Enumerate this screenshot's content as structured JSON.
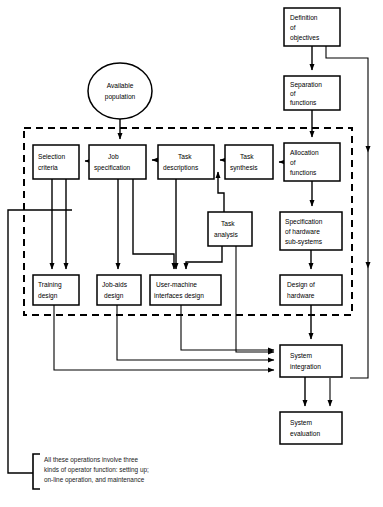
{
  "diagram": {
    "nodes": [
      {
        "id": "definition_objectives",
        "label": [
          "Definition",
          "of",
          "objectives"
        ],
        "shape": "box",
        "x": 284,
        "y": 8,
        "w": 56,
        "h": 38
      },
      {
        "id": "separation_functions",
        "label": [
          "Separation",
          "of",
          "functions"
        ],
        "shape": "box",
        "x": 284,
        "y": 76,
        "w": 56,
        "h": 34
      },
      {
        "id": "allocation_functions",
        "label": [
          "Allocation",
          "of",
          "functions"
        ],
        "shape": "box",
        "x": 284,
        "y": 143,
        "w": 56,
        "h": 38
      },
      {
        "id": "specification_hardware",
        "label": [
          "Specification",
          "of hardware",
          "sub-systems"
        ],
        "shape": "box",
        "x": 280,
        "y": 212,
        "w": 62,
        "h": 38
      },
      {
        "id": "design_hardware",
        "label": [
          "Design of",
          "hardware"
        ],
        "shape": "box",
        "x": 280,
        "y": 275,
        "w": 62,
        "h": 30
      },
      {
        "id": "available_population",
        "label": [
          "Available",
          "population"
        ],
        "shape": "ellipse",
        "x": 88,
        "y": 63,
        "w": 64,
        "h": 56
      },
      {
        "id": "selection_criteria",
        "label": [
          "Selection",
          "criteria"
        ],
        "shape": "box",
        "x": 33,
        "y": 145,
        "w": 46,
        "h": 34
      },
      {
        "id": "job_specification",
        "label": [
          "Job",
          "specification"
        ],
        "shape": "box",
        "x": 89,
        "y": 145,
        "w": 57,
        "h": 34
      },
      {
        "id": "task_descriptions",
        "label": [
          "Task",
          "descriptions"
        ],
        "shape": "box",
        "x": 158,
        "y": 145,
        "w": 56,
        "h": 34
      },
      {
        "id": "task_synthesis",
        "label": [
          "Task",
          "synthesis"
        ],
        "shape": "box",
        "x": 225,
        "y": 145,
        "w": 48,
        "h": 34
      },
      {
        "id": "task_analysis",
        "label": [
          "Task",
          "analysis"
        ],
        "shape": "box",
        "x": 208,
        "y": 212,
        "w": 44,
        "h": 34
      },
      {
        "id": "training_design",
        "label": [
          "Training",
          "design"
        ],
        "shape": "box",
        "x": 33,
        "y": 275,
        "w": 46,
        "h": 30
      },
      {
        "id": "job_aids_design",
        "label": [
          "Job-aids",
          "design"
        ],
        "shape": "box",
        "x": 97,
        "y": 275,
        "w": 44,
        "h": 30
      },
      {
        "id": "user_machine_interfaces_design",
        "label": [
          "User-machine",
          "interfaces design"
        ],
        "shape": "box",
        "x": 150,
        "y": 275,
        "w": 71,
        "h": 30
      },
      {
        "id": "system_integration",
        "label": [
          "System",
          "integration"
        ],
        "shape": "box",
        "x": 280,
        "y": 345,
        "w": 62,
        "h": 32
      },
      {
        "id": "system_evaluation",
        "label": [
          "System",
          "evaluation"
        ],
        "shape": "box",
        "x": 280,
        "y": 412,
        "w": 62,
        "h": 32
      }
    ],
    "dashed_region": {
      "x": 24,
      "y": 128,
      "w": 328,
      "h": 187,
      "label": "operator-task-design-region"
    },
    "legend": {
      "lines": [
        "All these operations involve three",
        "kinds of operator function: setting up;",
        "on-line operation, and maintenance"
      ]
    },
    "caption": ""
  }
}
